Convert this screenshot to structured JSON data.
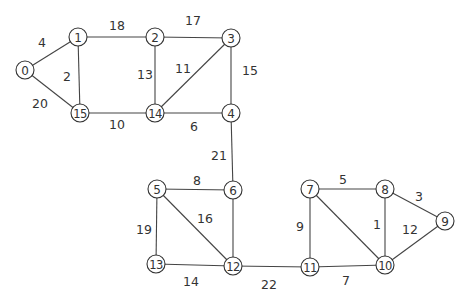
{
  "graph": {
    "type": "weighted-undirected",
    "nodes": [
      {
        "id": "0",
        "x": 25,
        "y": 70
      },
      {
        "id": "1",
        "x": 78,
        "y": 37
      },
      {
        "id": "2",
        "x": 155,
        "y": 37
      },
      {
        "id": "3",
        "x": 231,
        "y": 38
      },
      {
        "id": "4",
        "x": 231,
        "y": 113
      },
      {
        "id": "5",
        "x": 157,
        "y": 189
      },
      {
        "id": "6",
        "x": 233,
        "y": 190
      },
      {
        "id": "7",
        "x": 310,
        "y": 189
      },
      {
        "id": "8",
        "x": 385,
        "y": 189
      },
      {
        "id": "9",
        "x": 445,
        "y": 221
      },
      {
        "id": "10",
        "x": 385,
        "y": 265
      },
      {
        "id": "11",
        "x": 310,
        "y": 267
      },
      {
        "id": "12",
        "x": 233,
        "y": 266
      },
      {
        "id": "13",
        "x": 156,
        "y": 264
      },
      {
        "id": "14",
        "x": 155,
        "y": 113
      },
      {
        "id": "15",
        "x": 80,
        "y": 113
      }
    ],
    "edges": [
      {
        "from": "0",
        "to": "1",
        "weight": "4",
        "lx": 42,
        "ly": 42
      },
      {
        "from": "0",
        "to": "15",
        "weight": "20",
        "lx": 40,
        "ly": 103
      },
      {
        "from": "1",
        "to": "15",
        "weight": "2",
        "lx": 67,
        "ly": 76
      },
      {
        "from": "1",
        "to": "2",
        "weight": "18",
        "lx": 117,
        "ly": 25
      },
      {
        "from": "2",
        "to": "3",
        "weight": "17",
        "lx": 193,
        "ly": 20
      },
      {
        "from": "2",
        "to": "14",
        "weight": "13",
        "lx": 145,
        "ly": 74
      },
      {
        "from": "3",
        "to": "14",
        "weight": "11",
        "lx": 183,
        "ly": 68
      },
      {
        "from": "3",
        "to": "4",
        "weight": "15",
        "lx": 250,
        "ly": 70
      },
      {
        "from": "15",
        "to": "14",
        "weight": "10",
        "lx": 117,
        "ly": 124
      },
      {
        "from": "14",
        "to": "4",
        "weight": "6",
        "lx": 194,
        "ly": 126
      },
      {
        "from": "4",
        "to": "6",
        "weight": "21",
        "lx": 219,
        "ly": 155
      },
      {
        "from": "5",
        "to": "6",
        "weight": "8",
        "lx": 197,
        "ly": 180
      },
      {
        "from": "5",
        "to": "12",
        "weight": "16",
        "lx": 205,
        "ly": 218
      },
      {
        "from": "5",
        "to": "13",
        "weight": "19",
        "lx": 144,
        "ly": 229
      },
      {
        "from": "6",
        "to": "12",
        "weight": "",
        "lx": 0,
        "ly": 0
      },
      {
        "from": "13",
        "to": "12",
        "weight": "14",
        "lx": 191,
        "ly": 281
      },
      {
        "from": "12",
        "to": "11",
        "weight": "22",
        "lx": 269,
        "ly": 284
      },
      {
        "from": "7",
        "to": "11",
        "weight": "9",
        "lx": 300,
        "ly": 226
      },
      {
        "from": "7",
        "to": "8",
        "weight": "5",
        "lx": 343,
        "ly": 179
      },
      {
        "from": "7",
        "to": "10",
        "weight": "",
        "lx": 0,
        "ly": 0
      },
      {
        "from": "8",
        "to": "10",
        "weight": "1",
        "lx": 377,
        "ly": 224
      },
      {
        "from": "8",
        "to": "9",
        "weight": "3",
        "lx": 419,
        "ly": 196
      },
      {
        "from": "10",
        "to": "9",
        "weight": "12",
        "lx": 410,
        "ly": 229
      },
      {
        "from": "11",
        "to": "10",
        "weight": "7",
        "lx": 346,
        "ly": 280
      }
    ]
  }
}
